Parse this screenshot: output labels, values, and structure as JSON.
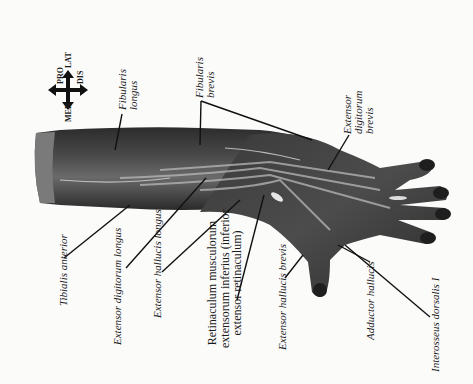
{
  "figure": {
    "orientation": "rotated 90 degrees counter-clockwise",
    "background_color": "#fbfbfa",
    "tissue_color": "#3a3a3a"
  },
  "compass": {
    "up_label": "PRO",
    "down_label": "DIS",
    "left_label": "MED",
    "right_label": "LAT",
    "icon": "four-way-arrow-icon"
  },
  "labels": {
    "fibularis_longus": "Fibularis longus",
    "fibularis_brevis": "Fibularis brevis",
    "extensor_digitorum_brevis": "Extensor digitorum brevis",
    "tibialis_anterior": "Tibialis anterior",
    "extensor_digitorum_longus": "Extensor digitorum longus",
    "extensor_hallucis_longus": "Extensor hallucis longus",
    "retinaculum_line1": "Retinaculum musculorum",
    "retinaculum_line2": "extensorum inferius (inferior",
    "retinaculum_line3": "extensor retinaculum)",
    "extensor_hallucis_brevis": "Extensor hallucis brevis",
    "adductor_hallucis": "Adductor hallucis",
    "interosseus_dorsalis": "Interosseus dorsalis I"
  }
}
